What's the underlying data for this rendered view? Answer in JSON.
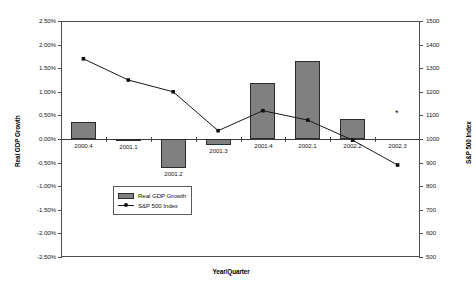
{
  "chart_data": {
    "type": "bar",
    "title": "",
    "subtitle": "",
    "xlabel": "Year/Quarter",
    "ylabel": "Real GDP Growth",
    "y2label": "S&P 500 Index",
    "categories": [
      "2000.4",
      "2001.1",
      "2001.2",
      "2001.3",
      "2001.4",
      "2002.1",
      "2002.2",
      "2002.3"
    ],
    "grid": false,
    "legend_position": "inside-bottom-left",
    "ylim": [
      -0.025,
      0.025
    ],
    "y2lim": [
      500,
      1500
    ],
    "yticks": [
      "2.50%",
      "2.00%",
      "1.50%",
      "1.00%",
      "0.50%",
      "0.00%",
      "-0.50%",
      "-1.00%",
      "-1.50%",
      "-2.00%",
      "-2.50%"
    ],
    "ytick_values": [
      2.5,
      2.0,
      1.5,
      1.0,
      0.5,
      0.0,
      -0.5,
      -1.0,
      -1.5,
      -2.0,
      -2.5
    ],
    "y2ticks": [
      "1500",
      "1400",
      "1300",
      "1200",
      "1100",
      "1000",
      "900",
      "800",
      "700",
      "600",
      "500"
    ],
    "y2tick_values": [
      1500,
      1400,
      1300,
      1200,
      1100,
      1000,
      900,
      800,
      700,
      600,
      500
    ],
    "series": [
      {
        "name": "Real GDP Growth",
        "type": "bar",
        "axis": "left",
        "unit": "percent",
        "values": [
          0.36,
          -0.05,
          -0.62,
          -0.12,
          1.18,
          1.65,
          0.43,
          null
        ]
      },
      {
        "name": "S&P 500 Index",
        "type": "line",
        "axis": "right",
        "marker": "filled-diamond",
        "values": [
          1340,
          1250,
          1200,
          1035,
          1120,
          1080,
          995,
          890
        ]
      }
    ],
    "annotations": [
      {
        "label": "*",
        "category": "2002.3",
        "y2_value": 1100,
        "note": "asterisk marker"
      }
    ]
  },
  "legend": {
    "items": [
      {
        "label": "Real GDP Growth",
        "marker": "bar-swatch"
      },
      {
        "label": "S&P 500 Index",
        "marker": "line-point"
      }
    ]
  }
}
